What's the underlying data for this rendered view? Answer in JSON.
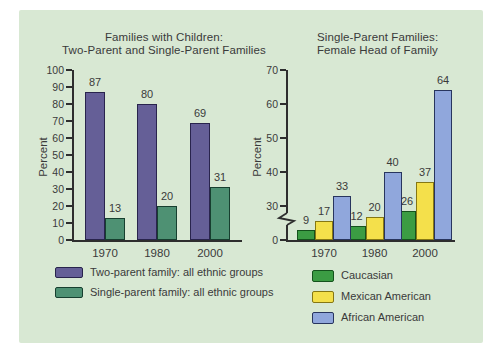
{
  "page": {
    "background": "#ffffff",
    "panel_bg": "#d8e8d3",
    "text_color": "#3a3a3a",
    "axis_color": "#2e2e2e"
  },
  "chart_data": [
    {
      "id": "families-with-children",
      "type": "bar",
      "title_lines": [
        "Families with Children:",
        "Two-Parent and Single-Parent Families"
      ],
      "ylabel": "Percent",
      "categories": [
        "1970",
        "1980",
        "2000"
      ],
      "series": [
        {
          "name": "Two-parent family: all ethnic groups",
          "values": [
            87,
            80,
            69
          ],
          "color": "#655f97",
          "border_color": "#29244d"
        },
        {
          "name": "Single-parent family: all ethnic groups",
          "values": [
            13,
            20,
            31
          ],
          "color": "#4e9173",
          "border_color": "#173f2f"
        }
      ],
      "ylim": [
        0,
        100
      ],
      "yticks": [
        0,
        10,
        20,
        30,
        40,
        50,
        60,
        70,
        80,
        90,
        100
      ],
      "axis_break": false,
      "grid": false,
      "legend_position": "below"
    },
    {
      "id": "single-parent-female-head",
      "type": "bar",
      "title_lines": [
        "Single-Parent Families:",
        "Female Head of Family"
      ],
      "ylabel": "Percent",
      "categories": [
        "1970",
        "1980",
        "2000"
      ],
      "series": [
        {
          "name": "Caucasian",
          "values": [
            9,
            12,
            26
          ],
          "color": "#3b9c43",
          "border_color": "#14521c"
        },
        {
          "name": "Mexican American",
          "values": [
            17,
            20,
            37
          ],
          "color": "#f4e04b",
          "border_color": "#857714"
        },
        {
          "name": "African American",
          "values": [
            33,
            40,
            64
          ],
          "color": "#90a7dc",
          "border_color": "#28355e"
        }
      ],
      "ylim": [
        0,
        70
      ],
      "yticks": [
        0,
        30,
        40,
        50,
        60,
        70
      ],
      "axis_break": true,
      "axis_break_range": [
        0,
        30
      ],
      "grid": false,
      "legend_position": "below"
    }
  ]
}
